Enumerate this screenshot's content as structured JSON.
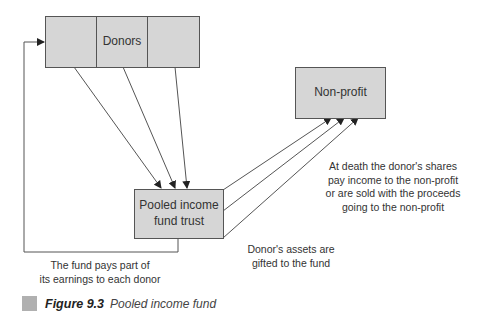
{
  "nodes": {
    "donors": {
      "label": "Donors"
    },
    "non_profit": {
      "label": "Non-profit"
    },
    "pooled_trust": {
      "label_line1": "Pooled income",
      "label_line2": "fund trust"
    }
  },
  "annotations": {
    "at_death": {
      "line1": "At death the donor's shares",
      "line2": "pay income to the non-profit",
      "line3": "or are sold with the proceeds",
      "line4": "going to the non-profit"
    },
    "assets_gifted": {
      "line1": "Donor's assets are",
      "line2": "gifted to the fund"
    },
    "fund_pays": {
      "line1": "The fund pays part of",
      "line2": "its earnings to each donor"
    }
  },
  "caption": {
    "figure_number": "Figure 9.3",
    "title": "Pooled income fund"
  },
  "colors": {
    "box_fill": "#d6d6d6",
    "stroke": "#555555",
    "caption_swatch": "#b0b0b0"
  }
}
